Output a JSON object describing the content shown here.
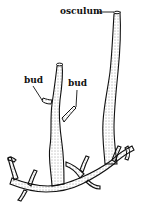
{
  "figure": {
    "labels": {
      "osculum": "osculum",
      "bud_left": "bud",
      "bud_right": "bud"
    },
    "colors": {
      "ink": "#111111",
      "background": "#ffffff"
    }
  }
}
